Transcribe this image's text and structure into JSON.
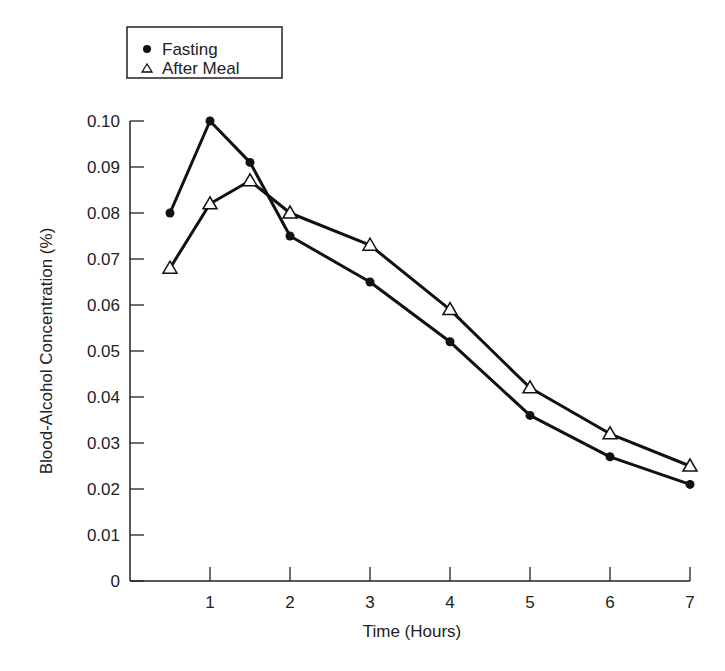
{
  "chart_data": {
    "type": "line",
    "title": "",
    "xlabel": "Time (Hours)",
    "ylabel": "Blood-Alcohol Concentration (%)",
    "xlim": [
      0,
      7
    ],
    "ylim": [
      0,
      0.1
    ],
    "x_ticks": [
      1,
      2,
      3,
      4,
      5,
      6,
      7
    ],
    "x_tick_labels": [
      "1",
      "2",
      "3",
      "4",
      "5",
      "6",
      "7"
    ],
    "y_ticks": [
      0,
      0.01,
      0.02,
      0.03,
      0.04,
      0.05,
      0.06,
      0.07,
      0.08,
      0.09,
      0.1
    ],
    "y_tick_labels": [
      "0",
      "0.01",
      "0.02",
      "0.03",
      "0.04",
      "0.05",
      "0.06",
      "0.07",
      "0.08",
      "0.09",
      "0.10"
    ],
    "grid": false,
    "legend_position": "top-left, above plot",
    "x": [
      0.5,
      1,
      1.5,
      2,
      3,
      4,
      5,
      6,
      7
    ],
    "series": [
      {
        "name": "Fasting",
        "marker": "filled-circle",
        "color": "#111111",
        "values": [
          0.08,
          0.1,
          0.091,
          0.075,
          0.065,
          0.052,
          0.036,
          0.027,
          0.021
        ]
      },
      {
        "name": "After Meal",
        "marker": "open-triangle",
        "color": "#111111",
        "values": [
          0.068,
          0.082,
          0.087,
          0.08,
          0.073,
          0.059,
          0.042,
          0.032,
          0.025
        ]
      }
    ]
  },
  "legend": {
    "items": [
      {
        "label": "Fasting",
        "marker": "filled-circle"
      },
      {
        "label": "After Meal",
        "marker": "open-triangle"
      }
    ]
  }
}
